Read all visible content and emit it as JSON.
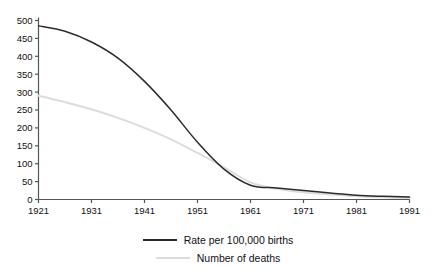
{
  "chart_data": {
    "type": "line",
    "title": "",
    "subtitle": "",
    "xlabel": "",
    "ylabel": "",
    "xlim": [
      1921,
      1991
    ],
    "ylim": [
      0,
      500
    ],
    "grid": false,
    "legend_position": "bottom-center",
    "x_ticks": [
      "1921",
      "1931",
      "1941",
      "1951",
      "1961",
      "1971",
      "1981",
      "1991"
    ],
    "y_ticks": [
      "0",
      "50",
      "100",
      "150",
      "200",
      "250",
      "300",
      "350",
      "400",
      "450",
      "500"
    ],
    "x": [
      1921,
      1926,
      1931,
      1936,
      1941,
      1946,
      1951,
      1956,
      1961,
      1966,
      1971,
      1976,
      1981,
      1986,
      1991
    ],
    "series": [
      {
        "name": "Rate per 100,000 births",
        "color": "#2b2b2b",
        "values": [
          485,
          470,
          440,
          395,
          330,
          250,
          160,
          85,
          40,
          32,
          25,
          18,
          12,
          9,
          7
        ]
      },
      {
        "name": "Number of deaths",
        "color": "#dcdcdc",
        "values": [
          290,
          272,
          252,
          228,
          200,
          168,
          130,
          90,
          48,
          30,
          20,
          14,
          9,
          6,
          4
        ]
      }
    ]
  },
  "legend": {
    "items": [
      {
        "label": "Rate per 100,000 births",
        "swatch": "primary"
      },
      {
        "label": "Number of deaths",
        "swatch": "secondary"
      }
    ]
  },
  "footer": {
    "clipped_text": ""
  },
  "colors": {
    "background": "#ffffff",
    "axis": "#555555",
    "primary_series": "#2b2b2b",
    "secondary_series": "#dcdcdc",
    "text": "#111111"
  }
}
